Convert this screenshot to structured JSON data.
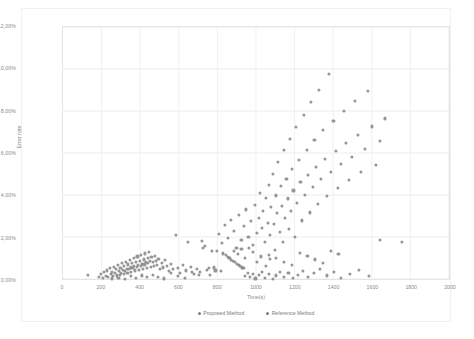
{
  "chart_data": {
    "type": "scatter",
    "title": "",
    "xlabel": "Time(s)",
    "ylabel": "Error rate",
    "xlim": [
      0,
      2000
    ],
    "ylim": [
      0,
      0.12
    ],
    "xticks": [
      "0",
      "200",
      "400",
      "600",
      "800",
      "1000",
      "1200",
      "1400",
      "1600",
      "1800",
      "2000"
    ],
    "xtick_values": [
      0,
      200,
      400,
      600,
      800,
      1000,
      1200,
      1400,
      1600,
      1800,
      2000
    ],
    "yticks": [
      "0,00%",
      "2,00%",
      "4,00%",
      "6,00%",
      "8,00%",
      "10,00%",
      "12,00%"
    ],
    "ytick_values": [
      0,
      0.02,
      0.04,
      0.06,
      0.08,
      0.1,
      0.12
    ],
    "grid": true,
    "legend_position": "bottom",
    "marker_color": "#808080",
    "series": [
      {
        "name": "Proposed Method",
        "color": "#7f7f7f",
        "points": [
          [
            130,
            0.0028
          ],
          [
            186,
            0.002
          ],
          [
            196,
            0.0035
          ],
          [
            205,
            0.0014
          ],
          [
            212,
            0.0042
          ],
          [
            220,
            0.0025
          ],
          [
            228,
            0.005
          ],
          [
            234,
            0.0018
          ],
          [
            240,
            0.006
          ],
          [
            246,
            0.0032
          ],
          [
            252,
            0.0044
          ],
          [
            258,
            0.0022
          ],
          [
            262,
            0.0068
          ],
          [
            268,
            0.0038
          ],
          [
            272,
            0.0055
          ],
          [
            278,
            0.0026
          ],
          [
            282,
            0.0074
          ],
          [
            288,
            0.0046
          ],
          [
            292,
            0.003
          ],
          [
            296,
            0.0062
          ],
          [
            300,
            0.004
          ],
          [
            304,
            0.0086
          ],
          [
            308,
            0.0052
          ],
          [
            312,
            0.0034
          ],
          [
            316,
            0.007
          ],
          [
            320,
            0.0048
          ],
          [
            324,
            0.0092
          ],
          [
            328,
            0.0058
          ],
          [
            332,
            0.0038
          ],
          [
            336,
            0.0078
          ],
          [
            340,
            0.0056
          ],
          [
            344,
            0.01
          ],
          [
            348,
            0.0064
          ],
          [
            352,
            0.0044
          ],
          [
            356,
            0.0084
          ],
          [
            360,
            0.006
          ],
          [
            364,
            0.0108
          ],
          [
            368,
            0.007
          ],
          [
            372,
            0.005
          ],
          [
            376,
            0.009
          ],
          [
            380,
            0.0066
          ],
          [
            384,
            0.0116
          ],
          [
            388,
            0.0076
          ],
          [
            392,
            0.0054
          ],
          [
            396,
            0.0096
          ],
          [
            400,
            0.0072
          ],
          [
            404,
            0.0124
          ],
          [
            408,
            0.0082
          ],
          [
            412,
            0.0058
          ],
          [
            416,
            0.0102
          ],
          [
            420,
            0.0078
          ],
          [
            424,
            0.013
          ],
          [
            428,
            0.0088
          ],
          [
            432,
            0.0062
          ],
          [
            436,
            0.0108
          ],
          [
            440,
            0.0084
          ],
          [
            444,
            0.0136
          ],
          [
            448,
            0.0094
          ],
          [
            452,
            0.0066
          ],
          [
            456,
            0.0112
          ],
          [
            462,
            0.009
          ],
          [
            468,
            0.007
          ],
          [
            474,
            0.0118
          ],
          [
            480,
            0.0096
          ],
          [
            486,
            0.0074
          ],
          [
            492,
            0.0104
          ],
          [
            500,
            0.0058
          ],
          [
            508,
            0.0086
          ],
          [
            516,
            0.0064
          ],
          [
            524,
            0.0098
          ],
          [
            534,
            0.0072
          ],
          [
            544,
            0.0046
          ],
          [
            556,
            0.008
          ],
          [
            568,
            0.0056
          ],
          [
            580,
            0.0216
          ],
          [
            592,
            0.0062
          ],
          [
            604,
            0.004
          ],
          [
            618,
            0.0074
          ],
          [
            632,
            0.005
          ],
          [
            646,
            0.0184
          ],
          [
            660,
            0.0066
          ],
          [
            674,
            0.0034
          ],
          [
            690,
            0.0058
          ],
          [
            706,
            0.0044
          ],
          [
            722,
            0.0156
          ],
          [
            740,
            0.0052
          ],
          [
            758,
            0.003
          ],
          [
            776,
            0.0064
          ],
          [
            794,
            0.0142
          ],
          [
            812,
            0.0046
          ],
          [
            826,
            0.013
          ],
          [
            838,
            0.0122
          ],
          [
            848,
            0.0114
          ],
          [
            858,
            0.0108
          ],
          [
            868,
            0.01
          ],
          [
            878,
            0.0094
          ],
          [
            888,
            0.0088
          ],
          [
            898,
            0.0082
          ],
          [
            906,
            0.0076
          ],
          [
            914,
            0.007
          ],
          [
            922,
            0.0064
          ],
          [
            930,
            0.006
          ],
          [
            940,
            0.0024
          ],
          [
            952,
            0.004
          ],
          [
            964,
            0.0018
          ],
          [
            978,
            0.0034
          ],
          [
            992,
            0.0012
          ],
          [
            1008,
            0.0028
          ],
          [
            1024,
            0.0044
          ],
          [
            1040,
            0.0016
          ],
          [
            1060,
            0.0032
          ],
          [
            1080,
            0.001
          ],
          [
            1100,
            0.0026
          ],
          [
            1120,
            0.0042
          ],
          [
            1140,
            0.0018
          ],
          [
            1162,
            0.0036
          ],
          [
            1186,
            0.0014
          ],
          [
            1210,
            0.003
          ],
          [
            1236,
            0.0048
          ],
          [
            1264,
            0.002
          ],
          [
            1294,
            0.0038
          ],
          [
            1326,
            0.0058
          ],
          [
            1360,
            0.0026
          ],
          [
            1396,
            0.0044
          ],
          [
            1434,
            0.0016
          ],
          [
            1478,
            0.0034
          ],
          [
            1524,
            0.0052
          ],
          [
            1576,
            0.0022
          ],
          [
            1632,
            0.0196
          ],
          [
            1748,
            0.0186
          ]
        ]
      },
      {
        "name": "Reference Method",
        "color": "#7f7f7f",
        "points": [
          [
            252,
            0.0012
          ],
          [
            286,
            0.0016
          ],
          [
            318,
            0.001
          ],
          [
            348,
            0.0022
          ],
          [
            378,
            0.0014
          ],
          [
            406,
            0.0026
          ],
          [
            434,
            0.0018
          ],
          [
            462,
            0.003
          ],
          [
            490,
            0.002
          ],
          [
            520,
            0.0012
          ],
          [
            556,
            0.0038
          ],
          [
            592,
            0.0024
          ],
          [
            628,
            0.0016
          ],
          [
            664,
            0.0042
          ],
          [
            700,
            0.0028
          ],
          [
            716,
            0.0188
          ],
          [
            734,
            0.0166
          ],
          [
            752,
            0.0062
          ],
          [
            768,
            0.0144
          ],
          [
            786,
            0.005
          ],
          [
            804,
            0.0222
          ],
          [
            820,
            0.0178
          ],
          [
            836,
            0.0266
          ],
          [
            852,
            0.0204
          ],
          [
            866,
            0.0288
          ],
          [
            880,
            0.0238
          ],
          [
            894,
            0.0156
          ],
          [
            908,
            0.031
          ],
          [
            920,
            0.0192
          ],
          [
            932,
            0.0262
          ],
          [
            944,
            0.0338
          ],
          [
            956,
            0.021
          ],
          [
            968,
            0.0284
          ],
          [
            978,
            0.0172
          ],
          [
            988,
            0.036
          ],
          [
            998,
            0.0228
          ],
          [
            1008,
            0.03
          ],
          [
            1016,
            0.0418
          ],
          [
            1024,
            0.025
          ],
          [
            1032,
            0.033
          ],
          [
            1040,
            0.0186
          ],
          [
            1048,
            0.0392
          ],
          [
            1056,
            0.0276
          ],
          [
            1062,
            0.0452
          ],
          [
            1068,
            0.0216
          ],
          [
            1074,
            0.0348
          ],
          [
            1080,
            0.0506
          ],
          [
            1086,
            0.0268
          ],
          [
            1092,
            0.0148
          ],
          [
            1098,
            0.0404
          ],
          [
            1104,
            0.0322
          ],
          [
            1110,
            0.0562
          ],
          [
            1116,
            0.0232
          ],
          [
            1122,
            0.0448
          ],
          [
            1128,
            0.0354
          ],
          [
            1134,
            0.0186
          ],
          [
            1140,
            0.0618
          ],
          [
            1146,
            0.0296
          ],
          [
            1152,
            0.0482
          ],
          [
            1158,
            0.039
          ],
          [
            1164,
            0.0244
          ],
          [
            1170,
            0.0672
          ],
          [
            1176,
            0.0332
          ],
          [
            1182,
            0.0528
          ],
          [
            1188,
            0.0428
          ],
          [
            1194,
            0.0208
          ],
          [
            1200,
            0.0726
          ],
          [
            1208,
            0.037
          ],
          [
            1216,
            0.0574
          ],
          [
            1224,
            0.0466
          ],
          [
            1232,
            0.0286
          ],
          [
            1240,
            0.0784
          ],
          [
            1248,
            0.0408
          ],
          [
            1256,
            0.062
          ],
          [
            1264,
            0.0502
          ],
          [
            1272,
            0.0324
          ],
          [
            1280,
            0.0846
          ],
          [
            1288,
            0.0444
          ],
          [
            1296,
            0.0666
          ],
          [
            1304,
            0.054
          ],
          [
            1312,
            0.0364
          ],
          [
            1320,
            0.0904
          ],
          [
            1330,
            0.048
          ],
          [
            1340,
            0.0712
          ],
          [
            1350,
            0.0578
          ],
          [
            1360,
            0.0402
          ],
          [
            1370,
            0.0978
          ],
          [
            1382,
            0.0516
          ],
          [
            1394,
            0.0758
          ],
          [
            1406,
            0.0616
          ],
          [
            1418,
            0.044
          ],
          [
            1432,
            0.0552
          ],
          [
            1446,
            0.0804
          ],
          [
            1460,
            0.0654
          ],
          [
            1474,
            0.0478
          ],
          [
            1490,
            0.0588
          ],
          [
            1506,
            0.0852
          ],
          [
            1522,
            0.0692
          ],
          [
            1538,
            0.0514
          ],
          [
            1556,
            0.0624
          ],
          [
            1574,
            0.09
          ],
          [
            1594,
            0.073
          ],
          [
            1614,
            0.055
          ],
          [
            1636,
            0.066
          ],
          [
            1660,
            0.0768
          ],
          [
            1060,
            0.0124
          ],
          [
            1100,
            0.0108
          ],
          [
            1140,
            0.0092
          ],
          [
            1180,
            0.0076
          ],
          [
            1220,
            0.0134
          ],
          [
            1260,
            0.0118
          ],
          [
            1300,
            0.0102
          ],
          [
            1340,
            0.0086
          ],
          [
            1380,
            0.0144
          ],
          [
            1420,
            0.0128
          ],
          [
            980,
            0.0136
          ],
          [
            1000,
            0.009
          ],
          [
            1020,
            0.0116
          ],
          [
            1044,
            0.0072
          ],
          [
            1068,
            0.0104
          ],
          [
            880,
            0.0142
          ],
          [
            900,
            0.0126
          ],
          [
            920,
            0.015
          ],
          [
            940,
            0.011
          ],
          [
            960,
            0.0158
          ]
        ]
      }
    ]
  },
  "axes": {
    "x_title": "Time(s)",
    "y_title": "Error rate"
  }
}
